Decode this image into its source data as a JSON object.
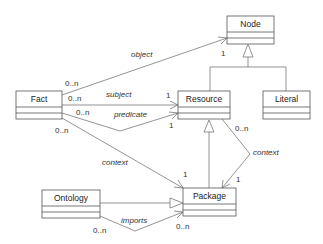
{
  "diagram": {
    "type": "UML class diagram",
    "classes": [
      {
        "id": "node",
        "name": "Node",
        "x": 227,
        "y": 16,
        "w": 47,
        "h": 28
      },
      {
        "id": "fact",
        "name": "Fact",
        "x": 16,
        "y": 90,
        "w": 46,
        "h": 28
      },
      {
        "id": "resource",
        "name": "Resource",
        "x": 178,
        "y": 90,
        "w": 52,
        "h": 28
      },
      {
        "id": "literal",
        "name": "Literal",
        "x": 263,
        "y": 90,
        "w": 47,
        "h": 28
      },
      {
        "id": "ontology",
        "name": "Ontology",
        "x": 42,
        "y": 190,
        "w": 58,
        "h": 28
      },
      {
        "id": "package",
        "name": "Package",
        "x": 183,
        "y": 188,
        "w": 53,
        "h": 28
      }
    ],
    "associations": [
      {
        "from": "fact",
        "to": "node",
        "label": "object",
        "from_mult": "0..n",
        "to_mult": "1"
      },
      {
        "from": "fact",
        "to": "resource",
        "label": "subject",
        "from_mult": "0..n",
        "to_mult": "1"
      },
      {
        "from": "fact",
        "to": "resource",
        "label": "predicate",
        "from_mult": "0..n",
        "to_mult": "1"
      },
      {
        "from": "fact",
        "to": "package",
        "label": "context",
        "from_mult": "0..n",
        "to_mult": "1"
      },
      {
        "from": "resource",
        "to": "package",
        "label": "context",
        "from_mult": "0..n",
        "to_mult": "1"
      },
      {
        "from": "ontology",
        "to": "package",
        "label": "imports",
        "from_mult": "0..n",
        "to_mult": "0..n"
      }
    ],
    "generalizations": [
      {
        "child": "resource",
        "parent": "node"
      },
      {
        "child": "literal",
        "parent": "node"
      },
      {
        "child": "package",
        "parent": "resource"
      },
      {
        "child": "ontology",
        "parent": "package"
      }
    ],
    "labels": {
      "object": "object",
      "subject": "subject",
      "predicate": "predicate",
      "context_fact": "context",
      "context_resource": "context",
      "imports": "imports",
      "m_object_from": "0..n",
      "m_object_to": "1",
      "m_subject_from": "0..n",
      "m_subject_to": "1",
      "m_predicate_from": "0..n",
      "m_predicate_to": "1",
      "m_context_fact_from": "0..n",
      "m_context_fact_to": "1",
      "m_context_res_from": "0..n",
      "m_context_res_to": "1",
      "m_imports_from": "0..n",
      "m_imports_to": "0..n"
    }
  }
}
